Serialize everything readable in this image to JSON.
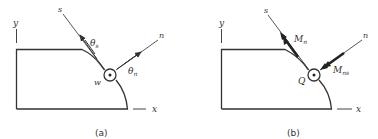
{
  "panels": [
    {
      "id": "a",
      "caption": "(a)",
      "axes": {
        "x": "x",
        "y": "y",
        "s": "s",
        "n": "n"
      },
      "point_label": "w",
      "vectors": [
        {
          "label_main": "θ",
          "label_sub": "s",
          "direction": "s",
          "style": "single-arrow"
        },
        {
          "label_main": "θ",
          "label_sub": "n",
          "direction": "n",
          "style": "single-arrow"
        }
      ]
    },
    {
      "id": "b",
      "caption": "(b)",
      "axes": {
        "x": "x",
        "y": "y",
        "s": "s",
        "n": "n"
      },
      "point_label": "Q",
      "vectors": [
        {
          "label_main": "M",
          "label_sub": "n",
          "direction": "s",
          "style": "double-arrow"
        },
        {
          "label_main": "M",
          "label_sub": "ns",
          "direction": "-n",
          "style": "double-arrow"
        }
      ]
    }
  ],
  "colors": {
    "line": "#333333",
    "background": "#ffffff"
  }
}
